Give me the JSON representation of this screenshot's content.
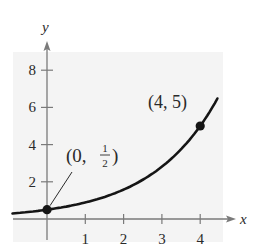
{
  "chart_data": {
    "type": "line",
    "title": "",
    "xlabel": "x",
    "ylabel": "y",
    "xlim": [
      -0.9,
      4.6
    ],
    "ylim": [
      -1.1,
      9.3
    ],
    "x_ticks": [
      1,
      2,
      3,
      4
    ],
    "y_ticks": [
      2,
      4,
      6,
      8
    ],
    "grid": false,
    "legend": null,
    "function": "y = (1/2) e^{kx}, k = ln(10)/4",
    "series": [
      {
        "name": "exponential curve",
        "x": [
          -0.9,
          0,
          0.5,
          1,
          1.5,
          2,
          2.5,
          3,
          3.5,
          4,
          4.45
        ],
        "values": [
          0.3,
          0.5,
          0.67,
          0.89,
          1.19,
          1.58,
          2.11,
          2.81,
          3.75,
          5.0,
          6.45
        ]
      }
    ],
    "points": [
      {
        "x": 0,
        "y": 0.5,
        "label_main": "(0, ",
        "label_num": "1",
        "label_den": "2",
        "label_close": ")"
      },
      {
        "x": 4,
        "y": 5,
        "label": "(4, 5)"
      }
    ],
    "annotations": [
      "(0, 1/2)",
      "(4, 5)"
    ]
  },
  "colors": {
    "panel": "#f4f4f4",
    "axis": "#7a7a7a",
    "curve": "#151515",
    "text": "#2a2a2a"
  }
}
